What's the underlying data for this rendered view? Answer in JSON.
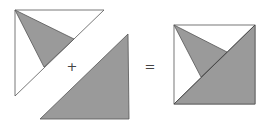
{
  "diagram": {
    "type": "geometric-dissection-equation",
    "colors": {
      "fill": "#9a9a9a",
      "stroke": "#555555",
      "background": "#ffffff"
    },
    "operators": [
      {
        "symbol": "+",
        "x": 72,
        "y": 66
      },
      {
        "symbol": "=",
        "x": 150,
        "y": 66
      }
    ],
    "shapes": {
      "left_outline_triangle": {
        "points": "15,10 104,10 15,96",
        "fill": "none"
      },
      "left_gray_triangle": {
        "points": "15,10 74,39 44,67",
        "fill": "gray"
      },
      "middle_gray_triangle": {
        "points": "128,34 129,119 40,119",
        "fill": "gray"
      },
      "result_square": {
        "x": 174,
        "y": 25,
        "width": 81,
        "height": 79
      },
      "result_gray_triangle_large": {
        "points": "255,25 255,104 174,104"
      },
      "result_gray_triangle_small": {
        "points": "174,25 227,52 201,77"
      }
    }
  }
}
